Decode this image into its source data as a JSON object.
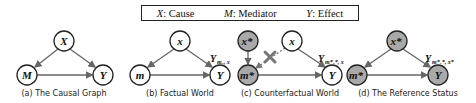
{
  "legend": {
    "items": [
      {
        "symbol": "X",
        "label": ": Cause"
      },
      {
        "symbol": "M",
        "label": ": Mediator"
      },
      {
        "symbol": "Y",
        "label": ": Effect"
      }
    ]
  },
  "colors": {
    "treated_fill": "#a9a9a9",
    "plain_fill": "#ffffff",
    "edge": "#666666",
    "cross": "#777777"
  },
  "panels": [
    {
      "caption": "(a) The Causal Graph",
      "nodes": {
        "top": "X",
        "left": "M",
        "right": "Y"
      },
      "outcome_label": ""
    },
    {
      "caption": "(b) Factual World",
      "nodes": {
        "top": "x",
        "left": "m",
        "right": "Y"
      },
      "outcome_label": "Y",
      "outcome_sub": "mₓ, x"
    },
    {
      "caption": "(c) Counterfactual World",
      "nodes": {
        "top_left": "x*",
        "top_right": "x",
        "left": "m*",
        "right": "Y"
      },
      "outcome_label": "Y",
      "outcome_sub": "m*ₓ*, x"
    },
    {
      "caption": "(d) The Reference Status",
      "nodes": {
        "top": "x*",
        "left": "m*",
        "right": "Y"
      },
      "outcome_label": "Y",
      "outcome_sub": "m*ₓ*, x*"
    }
  ]
}
